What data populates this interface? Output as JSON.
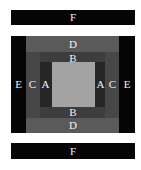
{
  "diagram": {
    "top_bar": {
      "label": "F"
    },
    "bottom_bar": {
      "label": "F"
    },
    "regions": {
      "outer_left": {
        "label": "E"
      },
      "outer_right": {
        "label": "E"
      },
      "band_top": {
        "label": "D"
      },
      "band_bottom": {
        "label": "D"
      },
      "col_left": {
        "label": "C"
      },
      "inner_top": {
        "label": "B"
      },
      "inner_bottom": {
        "label": "B"
      },
      "inner_left": {
        "label": "A"
      },
      "inner_right_a": {
        "label": "A"
      },
      "inner_right_c": {
        "label": "C"
      }
    },
    "colors": {
      "black": "#050505",
      "band_d": "#5a5a5a",
      "band_c": "#474747",
      "band_b": "#3d3d3d",
      "band_a": "#262626",
      "center": "#a3a3a3"
    }
  }
}
